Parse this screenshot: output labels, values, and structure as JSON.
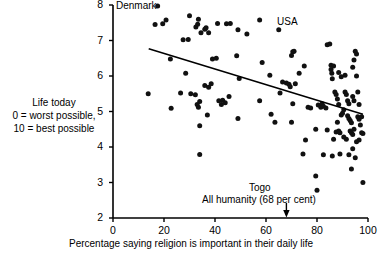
{
  "chart_data": {
    "type": "scatter",
    "title": "",
    "xlabel": "Percentage saying religion is important in their daily life",
    "ylabel": "Life today\n0 = worst possible,\n10 = best possible",
    "xlim": [
      0,
      100
    ],
    "ylim": [
      2,
      8
    ],
    "xticks": [
      0,
      20,
      40,
      60,
      80,
      100
    ],
    "yticks": [
      2,
      3,
      4,
      5,
      6,
      7,
      8
    ],
    "grid": false,
    "legend": null,
    "annotations": [
      {
        "text": "Denmark",
        "x": 14,
        "y": 7.97,
        "note": "labels point at far upper left"
      },
      {
        "text": "USA",
        "x": 65,
        "y": 7.55,
        "note": "labels point just below at ~(65,7.3)"
      },
      {
        "text": "Togo",
        "x": 63,
        "y": 2.85,
        "note": "labels point at ~(80,2.78)"
      },
      {
        "text": "All humanity (68 per cent)",
        "x": 68,
        "y": 2.55,
        "note": "arrow points down to x=68 on axis"
      }
    ],
    "arrow_marker": {
      "x": 68,
      "label": "All humanity (68 per cent)"
    },
    "trendline": {
      "x": [
        14,
        98
      ],
      "y": [
        6.77,
        4.92
      ]
    },
    "points": [
      [
        17.5,
        7.97
      ],
      [
        16.5,
        7.45
      ],
      [
        19.5,
        7.47
      ],
      [
        20.8,
        7.58
      ],
      [
        22.5,
        6.48
      ],
      [
        22.8,
        5.09
      ],
      [
        27.5,
        7.02
      ],
      [
        29.5,
        7.03
      ],
      [
        28.5,
        6.08
      ],
      [
        30.0,
        7.7
      ],
      [
        32.5,
        7.38
      ],
      [
        33.2,
        7.46
      ],
      [
        33.5,
        7.6
      ],
      [
        34.5,
        7.22
      ],
      [
        36.0,
        7.32
      ],
      [
        36.5,
        7.36
      ],
      [
        37.5,
        7.22
      ],
      [
        41.0,
        7.48
      ],
      [
        44.5,
        7.47
      ],
      [
        46.0,
        7.48
      ],
      [
        49.0,
        7.3
      ],
      [
        52.5,
        7.18
      ],
      [
        57.5,
        7.58
      ],
      [
        65.0,
        7.3
      ],
      [
        13.8,
        5.5
      ],
      [
        26.5,
        5.52
      ],
      [
        30.5,
        5.5
      ],
      [
        32.3,
        5.47
      ],
      [
        33.0,
        5.2
      ],
      [
        33.5,
        5.12
      ],
      [
        34.0,
        5.28
      ],
      [
        36.0,
        5.73
      ],
      [
        37.5,
        5.68
      ],
      [
        38.5,
        5.78
      ],
      [
        37.0,
        4.9
      ],
      [
        39.0,
        6.48
      ],
      [
        40.5,
        6.5
      ],
      [
        41.5,
        5.3
      ],
      [
        42.5,
        5.2
      ],
      [
        43.0,
        5.32
      ],
      [
        44.0,
        5.25
      ],
      [
        45.5,
        5.42
      ],
      [
        48.5,
        6.57
      ],
      [
        49.5,
        5.93
      ],
      [
        49.0,
        4.8
      ],
      [
        34.0,
        4.6
      ],
      [
        34.0,
        3.79
      ],
      [
        57.5,
        5.3
      ],
      [
        58.5,
        6.38
      ],
      [
        61.5,
        6.02
      ],
      [
        62.0,
        4.92
      ],
      [
        63.5,
        4.7
      ],
      [
        65.5,
        5.52
      ],
      [
        66.5,
        5.83
      ],
      [
        68.0,
        5.8
      ],
      [
        69.0,
        5.77
      ],
      [
        69.5,
        5.7
      ],
      [
        70.5,
        6.68
      ],
      [
        71.0,
        6.7
      ],
      [
        70.0,
        6.58
      ],
      [
        71.5,
        5.78
      ],
      [
        70.5,
        5.22
      ],
      [
        70.0,
        4.7
      ],
      [
        73.0,
        6.08
      ],
      [
        75.0,
        6.28
      ],
      [
        75.5,
        4.2
      ],
      [
        74.5,
        3.8
      ],
      [
        76.5,
        5.12
      ],
      [
        77.5,
        5.1
      ],
      [
        79.5,
        4.5
      ],
      [
        79.5,
        3.18
      ],
      [
        80.0,
        2.78
      ],
      [
        80.5,
        5.18
      ],
      [
        81.5,
        5.12
      ],
      [
        82.0,
        5.22
      ],
      [
        82.5,
        5.15
      ],
      [
        83.5,
        5.1
      ],
      [
        84.0,
        6.88
      ],
      [
        85.0,
        6.9
      ],
      [
        85.5,
        6.3
      ],
      [
        85.5,
        6.18
      ],
      [
        85.8,
        6.08
      ],
      [
        86.0,
        5.92
      ],
      [
        86.5,
        6.28
      ],
      [
        87.0,
        5.55
      ],
      [
        87.5,
        5.48
      ],
      [
        88.0,
        5.35
      ],
      [
        88.5,
        5.2
      ],
      [
        88.0,
        4.7
      ],
      [
        87.5,
        4.42
      ],
      [
        88.5,
        4.45
      ],
      [
        89.0,
        4.4
      ],
      [
        89.5,
        4.9
      ],
      [
        90.0,
        4.95
      ],
      [
        90.5,
        5.05
      ],
      [
        91.0,
        5.55
      ],
      [
        91.5,
        5.48
      ],
      [
        92.0,
        5.3
      ],
      [
        92.5,
        5.22
      ],
      [
        92.0,
        4.88
      ],
      [
        92.5,
        4.8
      ],
      [
        93.0,
        4.75
      ],
      [
        93.5,
        4.68
      ],
      [
        93.0,
        4.45
      ],
      [
        93.5,
        4.4
      ],
      [
        94.0,
        4.35
      ],
      [
        94.5,
        4.5
      ],
      [
        94.0,
        5.42
      ],
      [
        94.5,
        5.3
      ],
      [
        95.0,
        6.7
      ],
      [
        95.5,
        6.62
      ],
      [
        94.5,
        6.45
      ],
      [
        94.0,
        6.25
      ],
      [
        95.5,
        6.0
      ],
      [
        96.0,
        5.55
      ],
      [
        96.5,
        5.2
      ],
      [
        96.0,
        4.85
      ],
      [
        96.5,
        4.78
      ],
      [
        97.0,
        4.62
      ],
      [
        97.5,
        4.85
      ],
      [
        97.5,
        4.4
      ],
      [
        98.0,
        4.38
      ],
      [
        96.5,
        4.2
      ],
      [
        95.5,
        4.15
      ],
      [
        94.0,
        3.95
      ],
      [
        92.5,
        3.78
      ],
      [
        95.0,
        3.7
      ],
      [
        93.5,
        3.38
      ],
      [
        98.0,
        3.0
      ],
      [
        86.5,
        4.22
      ],
      [
        84.0,
        4.48
      ],
      [
        82.5,
        3.78
      ],
      [
        90.5,
        4.28
      ],
      [
        91.5,
        4.22
      ],
      [
        89.0,
        3.8
      ],
      [
        86.0,
        3.75
      ],
      [
        91.0,
        6.02
      ],
      [
        89.5,
        5.98
      ],
      [
        88.5,
        6.1
      ]
    ]
  },
  "axis": {
    "x_title": "Percentage saying religion is important in their daily life",
    "y_title_line1": "Life today",
    "y_title_line2": "0 = worst possible,",
    "y_title_line3": "10 = best possible",
    "xtick_labels": [
      "0",
      "20",
      "40",
      "60",
      "80",
      "100"
    ],
    "ytick_labels": [
      "8",
      "7",
      "6",
      "5",
      "4",
      "3",
      "2"
    ]
  },
  "labels": {
    "denmark": "Denmark",
    "usa": "USA",
    "togo": "Togo",
    "humanity": "All humanity (68 per cent)"
  },
  "colors": {
    "foreground": "#000000",
    "background": "#ffffff",
    "point": "#111111",
    "trendline": "#000000"
  }
}
